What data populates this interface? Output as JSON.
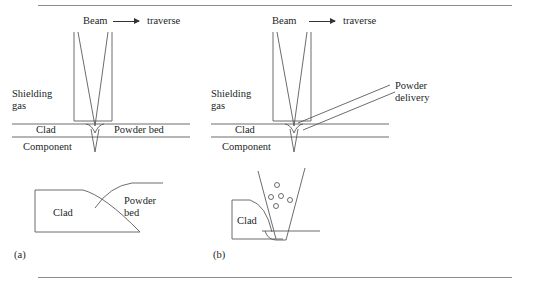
{
  "figure": {
    "panels": [
      {
        "id": "(a)",
        "process": "powder bed laser cladding",
        "labels": {
          "beam": "Beam",
          "traverse": "traverse",
          "shielding_gas": "Shielding\ngas",
          "clad_top": "Clad",
          "powder_bed_top": "Powder bed",
          "component": "Component",
          "clad_section": "Clad",
          "powder_bed_section": "Powder\nbed"
        }
      },
      {
        "id": "(b)",
        "process": "powder feed laser cladding",
        "labels": {
          "beam": "Beam",
          "traverse": "traverse",
          "shielding_gas": "Shielding\ngas",
          "powder_delivery": "Powder\ndelivery",
          "clad_top": "Clad",
          "component": "Component",
          "clad_section": "Clad"
        }
      }
    ],
    "icons": {
      "traverse_arrow": "arrow-right-icon",
      "powder_particle": "powder-particle-circle-icon"
    },
    "colors": {
      "line": "#5b5b5b",
      "rule": "#8c8c8c",
      "text": "#221f1f",
      "background": "#ffffff"
    },
    "particle_count": 5
  }
}
